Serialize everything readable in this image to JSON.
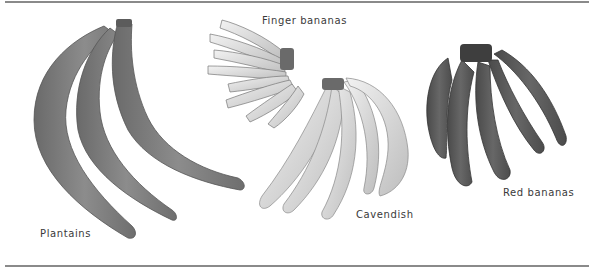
{
  "figure": {
    "labels": {
      "finger": "Finger bananas",
      "plantains": "Plantains",
      "cavendish": "Cavendish",
      "red": "Red bananas"
    },
    "colors": {
      "rule": "#8a8a8a",
      "plantain": "#7d7d7d",
      "finger": "#d6d6d6",
      "cavendish": "#e4e4e4",
      "red": "#5a5a5a",
      "label": "#3a3a3a"
    }
  }
}
